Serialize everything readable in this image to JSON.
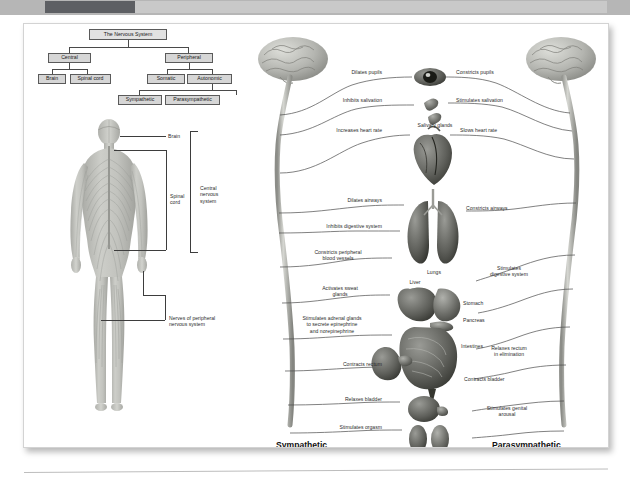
{
  "topbar": {
    "label": "scroll-progress"
  },
  "figure": {
    "tree": {
      "title": "The Nervous System",
      "nodes": [
        {
          "id": "root",
          "label": "The Nervous System"
        },
        {
          "id": "central",
          "label": "Central"
        },
        {
          "id": "peripheral",
          "label": "Peripheral"
        },
        {
          "id": "brain",
          "label": "Brain"
        },
        {
          "id": "spinal-cord",
          "label": "Spinal cord"
        },
        {
          "id": "somatic",
          "label": "Somatic"
        },
        {
          "id": "autonomic",
          "label": "Autonomic"
        },
        {
          "id": "sympathetic",
          "label": "Sympathetic"
        },
        {
          "id": "parasympathetic",
          "label": "Parasympathetic"
        }
      ]
    },
    "body_labels": {
      "brain": "Brain",
      "spinal_cord": "Spinal\ncord",
      "central_nervous_system": "Central\nnervous\nsystem",
      "peripheral_nerves": "Nerves of peripheral\nnervous system"
    },
    "ans": {
      "headings": {
        "left": "Sympathetic",
        "right": "Parasympathetic"
      },
      "sympathetic_effects": [
        "Dilates pupils",
        "Inhibits salivation",
        "Increases heart rate",
        "Dilates airways",
        "Inhibits digestive system",
        "Constricts peripheral\nblood vessels",
        "Activates sweat\nglands",
        "Stimulates adrenal glands\nto secrete epinephrine\nand norepinephrine",
        "Contracts rectum",
        "Relaxes bladder",
        "Stimulates orgasm"
      ],
      "parasympathetic_effects": [
        "Constricts pupils",
        "Stimulates salivation",
        "Slows heart rate",
        "Constricts airways",
        "Stimulates\ndigestive system",
        "Relaxes rectum\nin elimination",
        "Contracts bladder",
        "Stimulates genital\narousal"
      ],
      "organ_labels": [
        "Salivary glands",
        "Lungs",
        "Liver",
        "Stomach",
        "Pancreas",
        "Intestines"
      ]
    }
  },
  "colors": {
    "page_background": "#ffffff",
    "topbar_background": "#b6b6b6",
    "topbar_thumb": "#5d5f63",
    "node_fill": "#d6d6d6",
    "node_border": "#5a5a5a",
    "line": "#3d3d3d",
    "text": "#2b2b2b",
    "organ_tone": "#6f6f6f"
  }
}
